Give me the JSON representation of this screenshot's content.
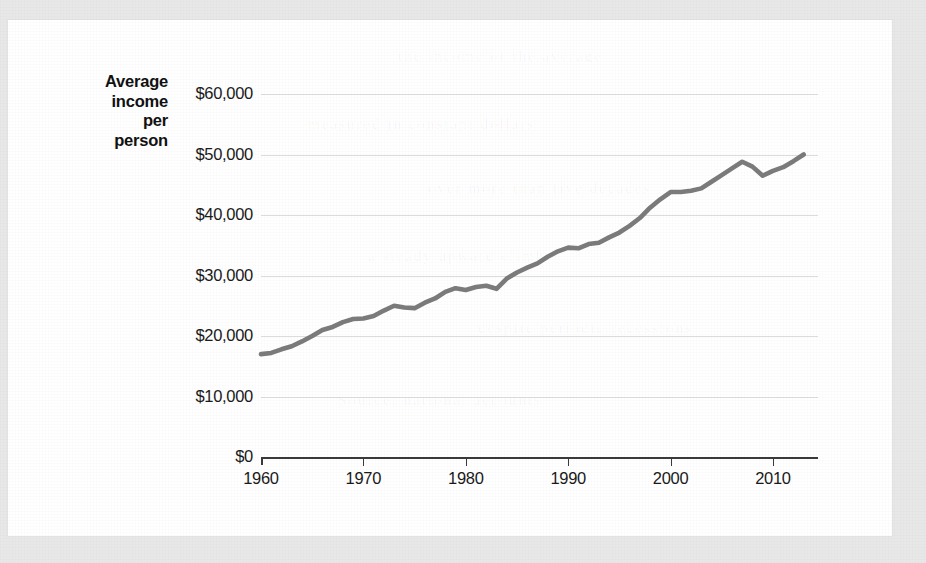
{
  "figure": {
    "y_axis_title_lines": [
      "Average",
      "income",
      "per",
      "person"
    ],
    "bleed_through_text": [
      "the income of the average",
      "measured in constant dollars",
      "over more than five decades",
      "a steady upward climb",
      "despite periodic recessions",
      "Source: national accounts"
    ]
  },
  "chart_data": {
    "type": "line",
    "title": "",
    "xlabel": "",
    "ylabel": "Average income per person",
    "xlim": [
      1960,
      2014
    ],
    "ylim": [
      0,
      60000
    ],
    "grid": true,
    "legend": "none",
    "line_color": "#7b7b7b",
    "axis_color": "#3a3a3a",
    "gridline_color": "#dddddd",
    "x_ticks": [
      1960,
      1970,
      1980,
      1990,
      2000,
      2010
    ],
    "x_tick_labels": [
      "1960",
      "1970",
      "1980",
      "1990",
      "2000",
      "2010"
    ],
    "y_ticks": [
      0,
      10000,
      20000,
      30000,
      40000,
      50000,
      60000
    ],
    "y_tick_labels": [
      "$0",
      "$10,000",
      "$20,000",
      "$30,000",
      "$40,000",
      "$50,000",
      "$60,000"
    ],
    "series_name": "Average income per person",
    "x": [
      1960,
      1961,
      1962,
      1963,
      1964,
      1965,
      1966,
      1967,
      1968,
      1969,
      1970,
      1971,
      1972,
      1973,
      1974,
      1975,
      1976,
      1977,
      1978,
      1979,
      1980,
      1981,
      1982,
      1983,
      1984,
      1985,
      1986,
      1987,
      1988,
      1989,
      1990,
      1991,
      1992,
      1993,
      1994,
      1995,
      1996,
      1997,
      1998,
      1999,
      2000,
      2001,
      2002,
      2003,
      2004,
      2005,
      2006,
      2007,
      2008,
      2009,
      2010,
      2011,
      2012,
      2013
    ],
    "y": [
      17000,
      17200,
      17800,
      18300,
      19100,
      20000,
      21000,
      21500,
      22300,
      22800,
      22900,
      23300,
      24200,
      25000,
      24700,
      24600,
      25500,
      26200,
      27300,
      27900,
      27600,
      28100,
      28300,
      27800,
      29500,
      30500,
      31300,
      32000,
      33100,
      34000,
      34600,
      34500,
      35200,
      35400,
      36300,
      37100,
      38200,
      39500,
      41200,
      42600,
      43800,
      43800,
      44000,
      44400,
      45500,
      46600,
      47700,
      48800,
      48000,
      46500,
      47300,
      47900,
      48900,
      50000
    ]
  }
}
